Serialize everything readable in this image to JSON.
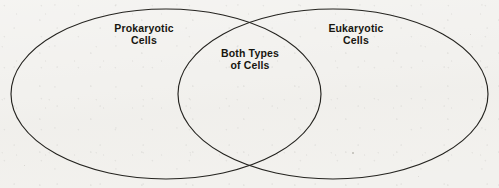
{
  "diagram": {
    "type": "venn",
    "title": "",
    "background_color": "#f2f1ee",
    "stroke_color": "#24231f",
    "text_color": "#17160f",
    "sets": [
      {
        "id": "left",
        "label": "Prokaryotic\nCells",
        "label_line1": "Prokaryotic",
        "label_line2": "Cells",
        "cx": 166,
        "cy": 94,
        "rx": 155,
        "ry": 85
      },
      {
        "id": "right",
        "label": "Eukaryotic\nCells",
        "label_line1": "Eukaryotic",
        "label_line2": "Cells",
        "cx": 333,
        "cy": 94,
        "rx": 155,
        "ry": 85
      }
    ],
    "intersection": {
      "id": "both",
      "label": "Both Types\nof Cells",
      "label_line1": "Both Types",
      "label_line2": "of Cells"
    }
  }
}
